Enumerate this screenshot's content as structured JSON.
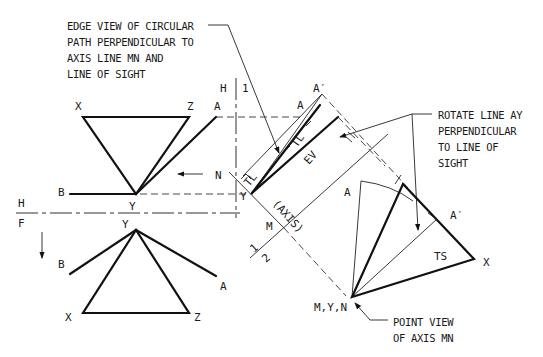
{
  "diagram": {
    "type": "descriptive-geometry-revolution",
    "notes": {
      "edge_view": [
        "EDGE VIEW OF CIRCULAR",
        "PATH PERPENDICULAR TO",
        "AXIS LINE MN AND",
        "LINE OF SIGHT"
      ],
      "rotate": [
        "ROTATE LINE AY",
        "PERPENDICULAR",
        "TO LINE OF",
        "SIGHT"
      ],
      "point_view": [
        "POINT VIEW",
        "OF AXIS MN"
      ]
    },
    "fold_lines": {
      "hf_top": "H",
      "hf_bottom": "F",
      "h1_left": "H",
      "h1_right": "1",
      "a12_left": "1",
      "a12_right": "2"
    },
    "top_view": {
      "points": {
        "x": "X",
        "z": "Z",
        "a": "A",
        "b": "B",
        "y": "Y",
        "n": "N"
      }
    },
    "front_view": {
      "points": {
        "y": "Y",
        "b": "B",
        "a": "A",
        "x": "X",
        "z": "Z"
      }
    },
    "aux1_view": {
      "points": {
        "a_prime": "A′",
        "a": "A",
        "y": "Y",
        "m": "M"
      },
      "annotations": {
        "tl1": "TL",
        "tl2": "TL",
        "ev": "EV",
        "axis": "(AXIS)"
      }
    },
    "aux2_view": {
      "points": {
        "a": "A",
        "a_prime": "A′",
        "x": "X",
        "myn": "M,Y,N"
      },
      "annotations": {
        "ts": "TS"
      }
    }
  }
}
